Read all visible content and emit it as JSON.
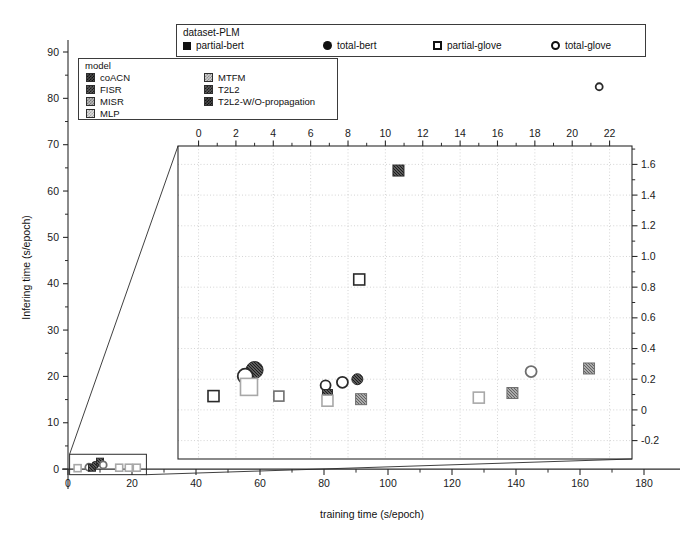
{
  "figure": {
    "outer": {
      "xlabel": "training time (s/epoch)",
      "ylabel": "Infering time (s/epoch)",
      "xticks": [
        0,
        20,
        40,
        60,
        80,
        100,
        120,
        140,
        160,
        180
      ],
      "yticks": [
        0,
        10,
        20,
        30,
        40,
        50,
        60,
        70,
        80,
        90
      ],
      "xlim": [
        0,
        190
      ],
      "ylim": [
        -3,
        90
      ]
    },
    "inset": {
      "xticks": [
        0,
        2,
        4,
        6,
        8,
        10,
        12,
        14,
        16,
        18,
        20,
        22
      ],
      "yticks": [
        "-0.2",
        "0",
        "0.2",
        "0.4",
        "0.6",
        "0.8",
        "1.0",
        "1.2",
        "1.4",
        "1.6"
      ],
      "xlim": [
        -1.1,
        23.2
      ],
      "ylim": [
        -0.32,
        1.72
      ],
      "xaxis_position": "top",
      "yaxis_position": "right",
      "grid": true
    }
  },
  "dataset_legend": {
    "title": "dataset-PLM",
    "items": [
      {
        "label": "partial-bert",
        "glyph": "filled-square",
        "glyph_class": "fsq",
        "x": 0
      },
      {
        "label": "total-bert",
        "glyph": "filled-circle",
        "glyph_class": "fci",
        "x": 140
      },
      {
        "label": "partial-glove",
        "glyph": "open-square",
        "glyph_class": "osq",
        "x": 250
      },
      {
        "label": "total-glove",
        "glyph": "open-circle",
        "glyph_class": "oci",
        "x": 368
      }
    ]
  },
  "model_legend": {
    "title": "model",
    "items": [
      {
        "label": "coACN",
        "swatch": "d1",
        "col": 0,
        "row": 0
      },
      {
        "label": "FISR",
        "swatch": "d2",
        "col": 0,
        "row": 1
      },
      {
        "label": "MISR",
        "swatch": "d3",
        "col": 0,
        "row": 2
      },
      {
        "label": "MLP",
        "swatch": "d4",
        "col": 0,
        "row": 3
      },
      {
        "label": "MTFM",
        "swatch": "d5",
        "col": 1,
        "row": 0
      },
      {
        "label": "T2L2",
        "swatch": "d2",
        "col": 1,
        "row": 1
      },
      {
        "label": "T2L2-W/O-propagation",
        "swatch": "d1",
        "col": 1,
        "row": 2
      }
    ]
  },
  "colors": {
    "axis": "#2a2a2a",
    "grid": "#c9c9c9",
    "marker_dark": "#3a3a3a",
    "marker_mid": "#777777",
    "marker_light": "#bdbdbd",
    "background": "#ffffff"
  },
  "chart_data": {
    "type": "scatter",
    "title": "",
    "xlabel": "training time (s/epoch)",
    "ylabel": "Infering time (s/epoch)",
    "xlim": [
      0,
      190
    ],
    "ylim": [
      -3,
      90
    ],
    "grid": false,
    "legend_position": "top",
    "series": [
      {
        "name": "partial-bert",
        "marker": "filled-square"
      },
      {
        "name": "total-bert",
        "marker": "filled-circle"
      },
      {
        "name": "partial-glove",
        "marker": "open-square"
      },
      {
        "name": "total-glove",
        "marker": "open-circle"
      }
    ],
    "outer_points": [
      {
        "x": 166.0,
        "y": 82.5,
        "marker": "open-circle",
        "shade": "dark",
        "model": "total-glove-outlier"
      },
      {
        "x": 3.0,
        "y": 0.2,
        "marker": "open-square",
        "shade": "light",
        "model": "cluster"
      },
      {
        "x": 6.5,
        "y": 0.4,
        "marker": "open-circle",
        "shade": "mid",
        "model": "cluster"
      },
      {
        "x": 7.5,
        "y": 0.3,
        "marker": "filled-square",
        "shade": "dark",
        "model": "cluster"
      },
      {
        "x": 8.5,
        "y": 0.9,
        "marker": "filled-circle",
        "shade": "dark",
        "model": "cluster"
      },
      {
        "x": 10.0,
        "y": 1.6,
        "marker": "filled-square",
        "shade": "dark",
        "model": "cluster"
      },
      {
        "x": 11.0,
        "y": 0.9,
        "marker": "open-circle",
        "shade": "mid",
        "model": "cluster"
      },
      {
        "x": 16.0,
        "y": 0.3,
        "marker": "open-square",
        "shade": "light",
        "model": "cluster"
      },
      {
        "x": 19.0,
        "y": 0.3,
        "marker": "open-square",
        "shade": "light",
        "model": "cluster"
      },
      {
        "x": 21.5,
        "y": 0.3,
        "marker": "open-square",
        "shade": "light",
        "model": "cluster"
      }
    ],
    "inset_points": [
      {
        "x": 10.7,
        "y": 1.56,
        "marker": "filled-square",
        "shade": "dark",
        "size": 11,
        "model": "T2L2-W/O-propagation"
      },
      {
        "x": 8.6,
        "y": 0.85,
        "marker": "open-square",
        "shade": "dark",
        "size": 11,
        "model": "T2L2-W/O-propagation"
      },
      {
        "x": 3.0,
        "y": 0.26,
        "marker": "filled-circle",
        "shade": "dark",
        "size": 17,
        "model": "coACN"
      },
      {
        "x": 2.5,
        "y": 0.22,
        "marker": "open-circle",
        "shade": "dark",
        "size": 15,
        "model": "coACN"
      },
      {
        "x": 2.7,
        "y": 0.15,
        "marker": "open-square",
        "shade": "light",
        "size": 17,
        "model": "coACN"
      },
      {
        "x": 0.8,
        "y": 0.09,
        "marker": "open-square",
        "shade": "dark",
        "size": 11,
        "model": "MLP"
      },
      {
        "x": 4.3,
        "y": 0.09,
        "marker": "open-square",
        "shade": "mid",
        "size": 10,
        "model": "MISR"
      },
      {
        "x": 6.8,
        "y": 0.16,
        "marker": "open-circle",
        "shade": "dark",
        "size": 10,
        "model": "FISR"
      },
      {
        "x": 6.9,
        "y": 0.1,
        "marker": "filled-square",
        "shade": "dark",
        "size": 10,
        "model": "FISR"
      },
      {
        "x": 6.9,
        "y": 0.06,
        "marker": "open-square",
        "shade": "light",
        "size": 11,
        "model": "FISR"
      },
      {
        "x": 7.7,
        "y": 0.18,
        "marker": "open-circle",
        "shade": "dark",
        "size": 11,
        "model": "MTFM"
      },
      {
        "x": 8.5,
        "y": 0.2,
        "marker": "filled-circle",
        "shade": "dark",
        "size": 11,
        "model": "MTFM"
      },
      {
        "x": 8.7,
        "y": 0.07,
        "marker": "filled-square",
        "shade": "mid",
        "size": 11,
        "model": "T2L2"
      },
      {
        "x": 15.0,
        "y": 0.08,
        "marker": "open-square",
        "shade": "light",
        "size": 11,
        "model": "MLP"
      },
      {
        "x": 16.8,
        "y": 0.11,
        "marker": "filled-square",
        "shade": "mid",
        "size": 11,
        "model": "MISR"
      },
      {
        "x": 17.8,
        "y": 0.25,
        "marker": "open-circle",
        "shade": "mid",
        "size": 11,
        "model": "MTFM"
      },
      {
        "x": 20.9,
        "y": 0.27,
        "marker": "filled-square",
        "shade": "mid",
        "size": 11,
        "model": "MISR"
      }
    ]
  }
}
